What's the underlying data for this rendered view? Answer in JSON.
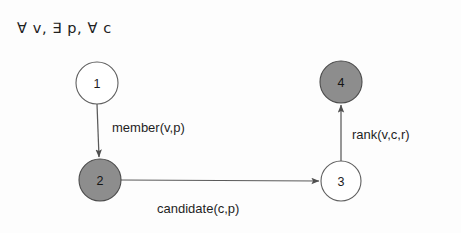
{
  "figure": {
    "quantifier_header": "∀ v, ∃ p, ∀ c",
    "background_color": "#fdfdfd",
    "node_fill_shaded": "#8d8d8d",
    "node_fill_plain": "#ffffff",
    "node_stroke_color": "#5f5f5f",
    "edge_stroke_color": "#5a5a5a"
  },
  "nodes": [
    {
      "id": "node-1",
      "label": "1",
      "shaded": false,
      "cx": 97,
      "cy": 83,
      "r": 21
    },
    {
      "id": "node-2",
      "label": "2",
      "shaded": true,
      "cx": 100,
      "cy": 180,
      "r": 21
    },
    {
      "id": "node-3",
      "label": "3",
      "shaded": false,
      "cx": 341,
      "cy": 181,
      "r": 20
    },
    {
      "id": "node-4",
      "label": "4",
      "shaded": true,
      "cx": 341,
      "cy": 82,
      "r": 21
    }
  ],
  "edges": [
    {
      "id": "edge-member",
      "label": "member(v,p)",
      "from": "node-1",
      "to": "node-2",
      "direction": "down"
    },
    {
      "id": "edge-candidate",
      "label": "candidate(c,p)",
      "from": "node-2",
      "to": "node-3",
      "direction": "right"
    },
    {
      "id": "edge-rank",
      "label": "rank(v,c,r)",
      "from": "node-3",
      "to": "node-4",
      "direction": "up"
    }
  ]
}
